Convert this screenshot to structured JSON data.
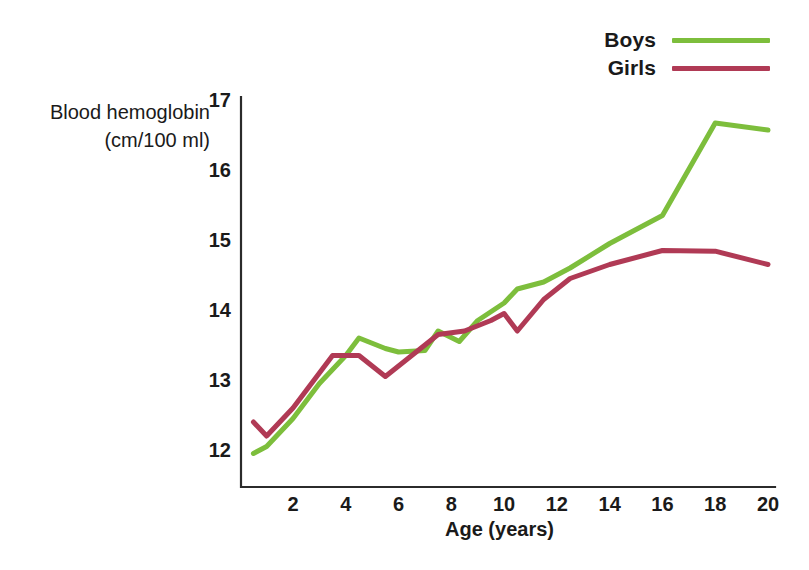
{
  "chart_data": {
    "type": "line",
    "title": "",
    "xlabel": "Age (years)",
    "ylabel": "Blood hemoglobin (cm/100 ml)",
    "ylabel_line1": "Blood hemoglobin",
    "ylabel_line2": "(cm/100 ml)",
    "xlim": [
      0,
      20
    ],
    "ylim": [
      11.6,
      17
    ],
    "xticks": [
      2,
      4,
      6,
      8,
      10,
      12,
      14,
      16,
      18,
      20
    ],
    "yticks": [
      12,
      13,
      14,
      15,
      16,
      17
    ],
    "grid": false,
    "legend_position": "top-right",
    "colors": {
      "boys": "#7DBE3C",
      "girls": "#B03A55",
      "axis": "#2b2b2b",
      "text": "#1a1a1a",
      "background": "#ffffff"
    },
    "series": [
      {
        "name": "Boys",
        "color": "#7DBE3C",
        "x": [
          0.5,
          1.0,
          2.0,
          3.0,
          4.0,
          4.5,
          5.5,
          6.0,
          7.0,
          7.5,
          8.3,
          9.0,
          10.0,
          10.5,
          11.5,
          12.5,
          14.0,
          16.0,
          18.0,
          20.0
        ],
        "y": [
          11.95,
          12.05,
          12.45,
          12.95,
          13.35,
          13.6,
          13.45,
          13.4,
          13.42,
          13.7,
          13.55,
          13.85,
          14.1,
          14.3,
          14.4,
          14.6,
          14.95,
          15.35,
          16.67,
          16.57
        ]
      },
      {
        "name": "Girls",
        "color": "#B03A55",
        "x": [
          0.5,
          1.0,
          2.0,
          3.0,
          3.5,
          4.5,
          5.5,
          6.5,
          7.5,
          8.5,
          9.5,
          10.0,
          10.5,
          11.5,
          12.5,
          14.0,
          16.0,
          18.0,
          20.0
        ],
        "y": [
          12.4,
          12.2,
          12.6,
          13.1,
          13.35,
          13.35,
          13.05,
          13.35,
          13.65,
          13.7,
          13.85,
          13.95,
          13.7,
          14.15,
          14.45,
          14.65,
          14.85,
          14.84,
          14.65
        ]
      }
    ],
    "legend": [
      {
        "label": "Boys",
        "color": "#7DBE3C"
      },
      {
        "label": "Girls",
        "color": "#B03A55"
      }
    ]
  }
}
